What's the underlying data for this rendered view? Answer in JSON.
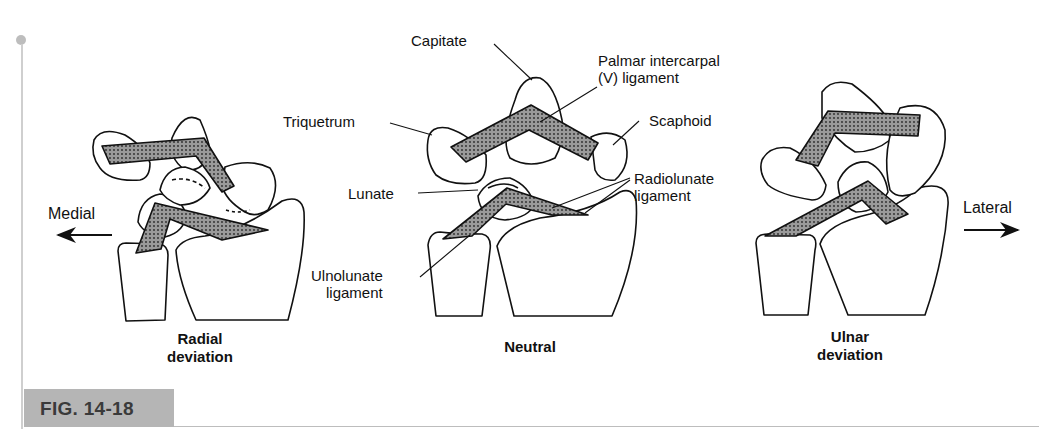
{
  "figure": {
    "number_label": "FIG. 14-18",
    "panels": [
      {
        "id": "radial",
        "caption": "Radial\ndeviation"
      },
      {
        "id": "neutral",
        "caption": "Neutral"
      },
      {
        "id": "ulnar",
        "caption": "Ulnar\ndeviation"
      }
    ],
    "labels": {
      "capitate": "Capitate",
      "palmar_intercarpal": "Palmar intercarpal\n(V) ligament",
      "triquetrum": "Triquetrum",
      "scaphoid": "Scaphoid",
      "lunate": "Lunate",
      "radiolunate": "Radiolunate\nligament",
      "ulnolunate": "Ulnolunate\nligament"
    },
    "directions": {
      "medial": "Medial",
      "lateral": "Lateral"
    },
    "colors": {
      "ligament_fill": "#8f8f8f",
      "ligament_dots": "#2a2a2a",
      "outline": "#111111",
      "fig_tab": "#b5b5b5",
      "rule": "#bdbdbd"
    }
  }
}
